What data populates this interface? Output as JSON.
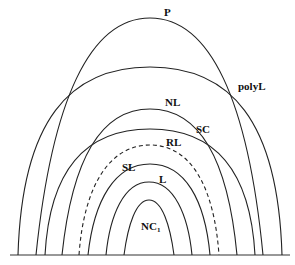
{
  "diagram": {
    "type": "nested-arch hierarchy diagram",
    "baseline": {
      "x1": 10,
      "x2": 290,
      "y": 255
    },
    "curves": [
      {
        "id": "polyL",
        "label": "polyL",
        "left": 18,
        "right": 282,
        "top": 67,
        "style": "solid",
        "label_pos": {
          "x": 238,
          "y": 90
        }
      },
      {
        "id": "P",
        "label": "P",
        "left": 36,
        "right": 263,
        "top": 18,
        "style": "solid",
        "label_pos": {
          "x": 164,
          "y": 16
        }
      },
      {
        "id": "SC",
        "label": "SC",
        "left": 45,
        "right": 255,
        "top": 129,
        "style": "solid",
        "label_pos": {
          "x": 196,
          "y": 133
        }
      },
      {
        "id": "NL",
        "label": "NL",
        "left": 62,
        "right": 237,
        "top": 109,
        "style": "solid",
        "label_pos": {
          "x": 165,
          "y": 106
        }
      },
      {
        "id": "RL",
        "label": "RL",
        "left": 79,
        "right": 219,
        "top": 145,
        "style": "dashed",
        "label_pos": {
          "x": 166,
          "y": 146
        }
      },
      {
        "id": "SL",
        "label": "SL",
        "left": 88,
        "right": 210,
        "top": 164,
        "style": "solid",
        "label_pos": {
          "x": 122,
          "y": 171
        }
      },
      {
        "id": "L",
        "label": "L",
        "left": 106,
        "right": 192,
        "top": 182,
        "style": "solid",
        "label_pos": {
          "x": 159,
          "y": 183
        }
      },
      {
        "id": "NC1",
        "label": "NC",
        "subscript": "1",
        "left": 124,
        "right": 174,
        "top": 200,
        "style": "solid",
        "label_pos": {
          "x": 141,
          "y": 230
        }
      }
    ]
  },
  "labels": {
    "P": "P",
    "polyL": "polyL",
    "NL": "NL",
    "SC": "SC",
    "RL": "RL",
    "SL": "SL",
    "L": "L",
    "NC1_main": "NC",
    "NC1_sub": "1"
  },
  "colors": {
    "stroke": "#222222",
    "background": "#ffffff",
    "text": "#111111"
  }
}
